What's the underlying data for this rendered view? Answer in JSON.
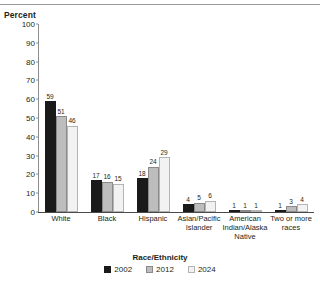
{
  "chart_data": {
    "type": "bar",
    "title": "",
    "xlabel": "",
    "ylabel": "Percent",
    "ylim": [
      0,
      100
    ],
    "yticks": [
      0,
      10,
      20,
      30,
      40,
      50,
      60,
      70,
      80,
      90,
      100
    ],
    "grid": false,
    "legend_position": "bottom-center",
    "legend_title": "Race/Ethnicity",
    "categories": [
      "White",
      "Black",
      "Hispanic",
      "Asian/Pacific Islander",
      "American Indian/Alaska Native",
      "Two or more races"
    ],
    "series": [
      {
        "name": "2002",
        "color": "#1a1a1a",
        "values": [
          59,
          17,
          18,
          4,
          1,
          1
        ]
      },
      {
        "name": "2012",
        "color": "#bdbdbd",
        "values": [
          51,
          16,
          24,
          5,
          1,
          3
        ]
      },
      {
        "name": "2024",
        "color": "#f2f2f2",
        "values": [
          46,
          15,
          29,
          6,
          1,
          4
        ]
      }
    ]
  },
  "axis": {
    "unit_label": "Percent"
  }
}
